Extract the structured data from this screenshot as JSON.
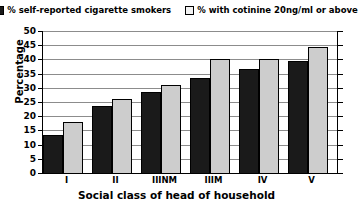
{
  "chart_data": {
    "type": "bar",
    "title": "",
    "xlabel": "Social class of head of household",
    "ylabel": "Percentage",
    "categories": [
      "I",
      "II",
      "IIINM",
      "IIIM",
      "IV",
      "V"
    ],
    "series": [
      {
        "name": "% self-reported cigarette smokers",
        "color": "#1a1a1a",
        "values": [
          13.5,
          23.5,
          28.5,
          33.5,
          36.5,
          39.5
        ]
      },
      {
        "name": "% with cotinine 20ng/ml or above",
        "color": "#cdcdcd",
        "values": [
          18,
          26,
          31,
          40,
          40,
          44.5
        ]
      }
    ],
    "ylim": [
      0,
      50
    ],
    "yticks": [
      0,
      5,
      10,
      15,
      20,
      25,
      30,
      35,
      40,
      45,
      50
    ],
    "ytick_labels": [
      "0",
      "5",
      "10",
      "15",
      "20",
      "25",
      "30",
      "35",
      "40",
      "45",
      "50"
    ],
    "grid": true,
    "legend_position": "top"
  },
  "legend": {
    "entries": [
      {
        "label": "% self-reported cigarette smokers",
        "swatch": "dark-swatch-icon"
      },
      {
        "label": "% with cotinine 20ng/ml or above",
        "swatch": "light-swatch-icon"
      }
    ]
  },
  "axes": {
    "y_title": "Percentage",
    "x_title": "Social class of head of household"
  }
}
